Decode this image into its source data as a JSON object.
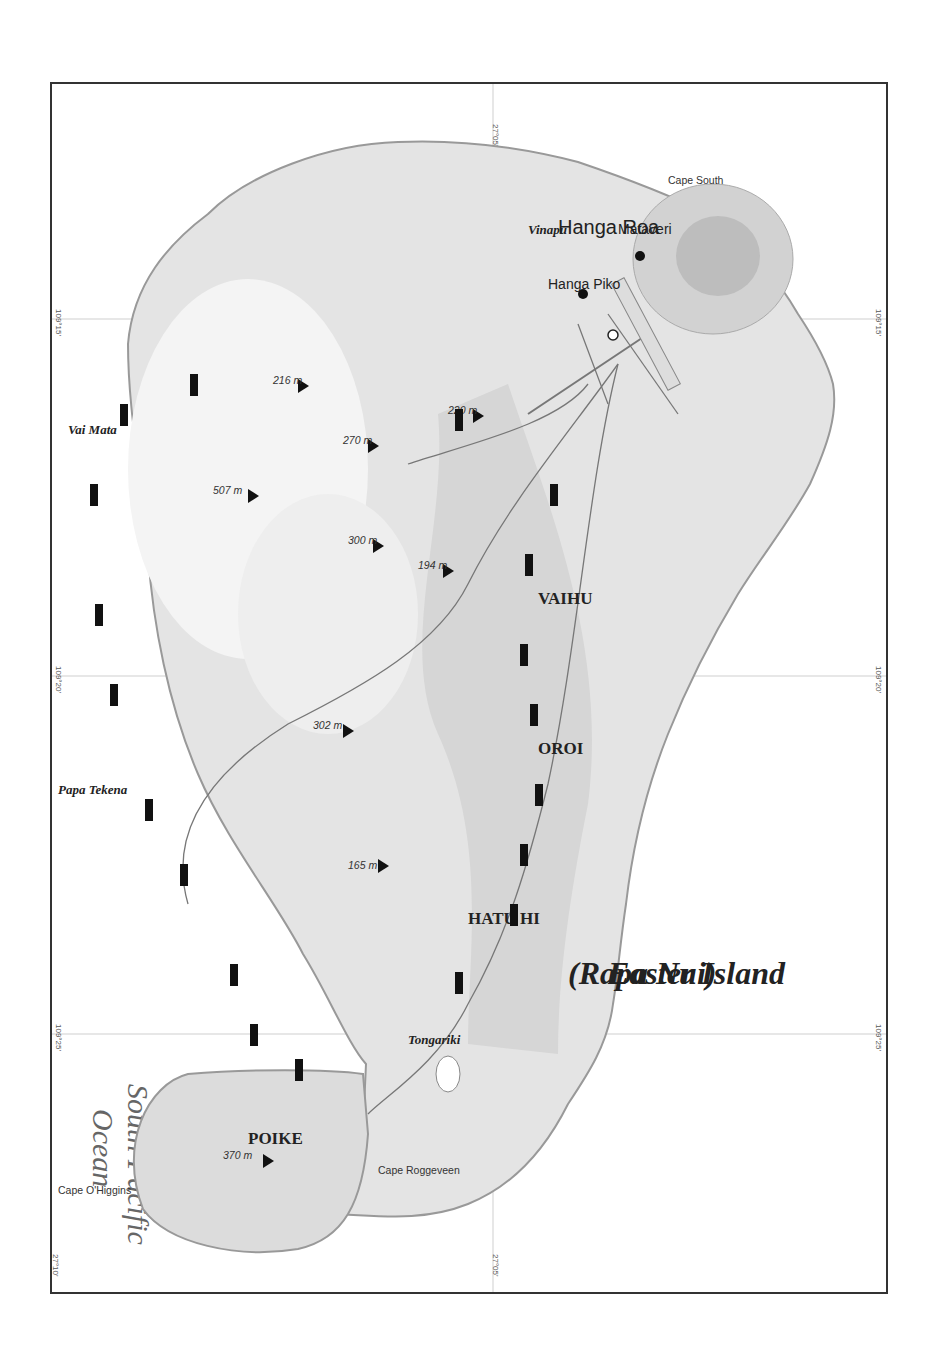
{
  "title": {
    "line1": "Easter Island",
    "line2": "(Rapa Nui)"
  },
  "ocean_label": {
    "line1": "South Pacific",
    "line2": "Ocean"
  },
  "coordinates": {
    "lon": [
      "109°15'",
      "109°20'",
      "109°25'"
    ],
    "lat": [
      "27°05'",
      "27°10'"
    ]
  },
  "elevation_legend": {
    "levels": [
      "507 m",
      "500 m",
      "450 m",
      "400 m",
      "350 m",
      "300 m",
      "250 m",
      "200 m",
      "150 m",
      "100 m",
      "50 m",
      "0"
    ],
    "colors": [
      "#d4d4d4",
      "#dedede",
      "#ececec",
      "#f6f6f6",
      "#f8f8f8",
      "#f4f4f4",
      "#eeeeee",
      "#e2e2e2",
      "#d6d6d6",
      "#cacaca",
      "#dadada",
      "#ececec"
    ]
  },
  "legend": {
    "items": [
      {
        "symbol": "road-line",
        "label": "Road or major track"
      },
      {
        "symbol": "minor-track-line",
        "label": "Minor track"
      },
      {
        "symbol": "populated-place-circles",
        "label": "Populated place"
      },
      {
        "symbol": "ahu-bar",
        "sample": "Vinapu",
        "label": "Ahu (ceremonial platform)"
      },
      {
        "symbol": "moai-dot",
        "label": "Moai"
      },
      {
        "symbol": "petroglyph-x",
        "label": "Petroglyphs"
      },
      {
        "symbol": "ruins-dots",
        "label": "Ruins"
      }
    ],
    "projection": "UTM projection (WGS84 datum)",
    "scale": "Scale: 1:372,000"
  },
  "scale_bar": {
    "km_label": "(km)",
    "mi_label": "(mi)",
    "km_ticks": [
      "0",
      "5"
    ],
    "mi_ticks": [
      "0",
      "3"
    ]
  },
  "inset_map": {
    "countries": [
      "BOLIVIA",
      "BRAZIL",
      "PARAGUAY",
      "URUGUAY",
      "ARGENTINA",
      "CHILE"
    ],
    "capital": "Santiago",
    "islands": [
      "Sala y Gómez Island",
      "Easter Island",
      "San Félix Island",
      "San Ambrosio Island",
      "Juan Fernández Islands"
    ],
    "scale": "2,000 km",
    "scale_zero": "0",
    "lon_ticks": [
      "130°",
      "120°",
      "110°",
      "100°",
      "90°",
      "80°",
      "70°",
      "60°",
      "50°",
      "40°"
    ],
    "lat_ticks": [
      "20°",
      "30°",
      "40°",
      "50°"
    ]
  },
  "districts": [
    "POIKE",
    "HATU HI",
    "OROI",
    "VAIHU"
  ],
  "towns": [
    "Hanga Roa",
    "Hanga Piko",
    "Mataveri"
  ],
  "airport": [
    "Mataveri",
    "International",
    "Airport"
  ],
  "peaks": [
    {
      "name": [
        "Volcano",
        "Puakatike"
      ],
      "elev": "370 m"
    },
    {
      "name": [
        "Volcano",
        "Rano",
        "Raraku"
      ],
      "elev": ""
    },
    {
      "name": [
        "Maunga",
        "Ana Marama"
      ],
      "elev": "165 m"
    },
    {
      "name": [
        "Mount Pui"
      ],
      "elev": "302 m"
    },
    {
      "name": [
        "Maunga",
        "Te Kahu Rere"
      ],
      "elev": ""
    },
    {
      "name": [
        "Volcano",
        "Terevaka"
      ],
      "elev": "507 m"
    },
    {
      "name": [
        "Maunga O Tu'u"
      ],
      "elev": "300 m"
    },
    {
      "name": [
        "Maunga",
        "Kote Miro Oone"
      ],
      "elev": "194 m"
    },
    {
      "name": [
        "Vaka Kipo"
      ],
      "elev": "216 m"
    },
    {
      "name": [
        "Mount Tuutapu"
      ],
      "elev": "270 m"
    },
    {
      "name": [
        "Maunga Orito"
      ],
      "elev": "220 m"
    },
    {
      "name": [
        "Volcano",
        "Rano Kau"
      ],
      "elev": ""
    }
  ],
  "ahu_sites": [
    "Tongariki",
    "Taharoa",
    "Tau A Ure",
    "Te Pito Kura",
    "Hekii",
    "Nau Nau",
    "Vai Tara Kai Ua",
    "Papa Tekena",
    "A Tanga",
    "Vai Mata",
    "Maikati Te Moa",
    "Te Peu",
    "A Kivi",
    "Tahai",
    "Te Ata Hero",
    "Ana Kai Tangata",
    "Orongo",
    "Vinapu",
    "Hanga Hahave",
    "Hanga Poukura",
    "Tarakiu",
    "Hanga Te'e",
    "Huri A Urenga",
    "Ura Uranga Te Mahina",
    "Akahanga",
    "Oroi",
    "Runga Va'e",
    "Hanga Tetenga",
    "Tu'u Tahi",
    "One Makihi"
  ],
  "coastal_features": [
    "Cape O'Higgins",
    "Cape Cumming",
    "Cape Roggeveen",
    "Motu Marotiri",
    "Point One Tea",
    "Hutuiti",
    "Bay",
    "La Pérouse",
    "Point Rosalia",
    "Caleta",
    "Anakena",
    "Point San Juan",
    "Cape Nord",
    "Motu Ko Hepoko",
    "Motu Tautara",
    "Point Cuidado",
    "Point Baja",
    "Benepu",
    "Harbour",
    "Point Kikiri Roa",
    "Cape South",
    "Motu Iti",
    "Motu Nui",
    "Motu Kau Kau"
  ]
}
